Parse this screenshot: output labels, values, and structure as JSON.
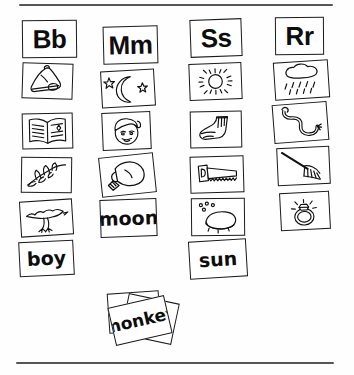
{
  "page": {
    "background_color": "#ffffff",
    "ink_color": "#1a1a1a",
    "rule_color": "#555555",
    "top_rule_label": "top-divider",
    "bottom_rule_label": "bottom-divider"
  },
  "columns": [
    {
      "id": "column-b",
      "letter": "Bb",
      "cards": [
        {
          "kind": "letter",
          "label": "Bb"
        },
        {
          "kind": "picture",
          "icon": "bell-icon",
          "label": "bell"
        },
        {
          "kind": "picture",
          "icon": "book-icon",
          "label": "book"
        },
        {
          "kind": "picture",
          "icon": "branch-icon",
          "label": "branch"
        },
        {
          "kind": "picture",
          "icon": "bird-icon",
          "label": "bird"
        },
        {
          "kind": "word",
          "label": "boy"
        }
      ]
    },
    {
      "id": "column-m",
      "letter": "Mm",
      "cards": [
        {
          "kind": "letter",
          "label": "Mm"
        },
        {
          "kind": "picture",
          "icon": "moon-stars-icon",
          "label": "moon"
        },
        {
          "kind": "picture",
          "icon": "man-face-icon",
          "label": "man"
        },
        {
          "kind": "picture",
          "icon": "mitten-icon",
          "label": "mitten"
        },
        {
          "kind": "word",
          "label": "moon"
        }
      ]
    },
    {
      "id": "column-s",
      "letter": "Ss",
      "cards": [
        {
          "kind": "letter",
          "label": "Ss"
        },
        {
          "kind": "picture",
          "icon": "sun-icon",
          "label": "sun"
        },
        {
          "kind": "picture",
          "icon": "sock-icon",
          "label": "sock"
        },
        {
          "kind": "picture",
          "icon": "saw-icon",
          "label": "saw"
        },
        {
          "kind": "picture",
          "icon": "soap-icon",
          "label": "soap"
        },
        {
          "kind": "word",
          "label": "sun"
        }
      ]
    },
    {
      "id": "column-r",
      "letter": "Rr",
      "cards": [
        {
          "kind": "letter",
          "label": "Rr"
        },
        {
          "kind": "picture",
          "icon": "rain-cloud-icon",
          "label": "rain"
        },
        {
          "kind": "picture",
          "icon": "rattlesnake-icon",
          "label": "rattlesnake"
        },
        {
          "kind": "picture",
          "icon": "rake-icon",
          "label": "rake"
        },
        {
          "kind": "picture",
          "icon": "ring-icon",
          "label": "ring"
        }
      ]
    }
  ],
  "bottom_stack": {
    "id": "monkey-card-stack",
    "label": "monkey",
    "card_count": 3
  }
}
